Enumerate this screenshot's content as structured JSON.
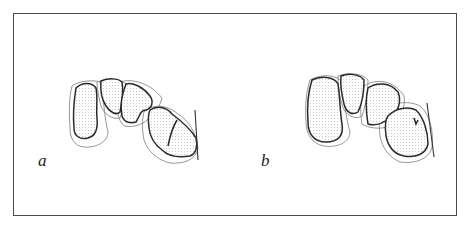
{
  "figure": {
    "panels": [
      {
        "id": "a",
        "label": "a"
      },
      {
        "id": "b",
        "label": "b"
      }
    ],
    "colors": {
      "frame": "#4a4a4a",
      "outer_outline": "#8a8a8a",
      "crown_outline": "#2a2a2a",
      "stipple": "#9a9a9a"
    }
  }
}
